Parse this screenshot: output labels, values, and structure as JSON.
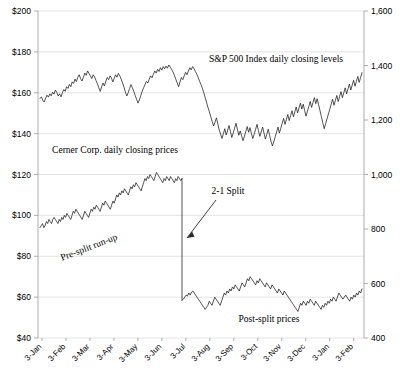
{
  "chart_data": {
    "type": "line",
    "title": "",
    "subtitle": "",
    "xlabel": "",
    "ylabel": "",
    "grid": true,
    "legend_position": "inline-annotations",
    "x_ticks": [
      "3-Jan",
      "3-Feb",
      "3-Mar",
      "3-Apr",
      "3-May",
      "3-Jun",
      "3-Jul",
      "3-Aug",
      "3-Sep",
      "3-Oct",
      "3-Nov",
      "3-Dec",
      "3-Jan",
      "3-Feb"
    ],
    "left_axis": {
      "ticks": [
        "$200",
        "$180",
        "$160",
        "$140",
        "$120",
        "$100",
        "$80",
        "$60",
        "$40"
      ],
      "values": [
        200,
        180,
        160,
        140,
        120,
        100,
        80,
        60,
        40
      ],
      "ylim": [
        40,
        200
      ],
      "format": "$"
    },
    "right_axis": {
      "ticks": [
        "1,600",
        "1,400",
        "1,200",
        "1,000",
        "800",
        "600",
        "400"
      ],
      "values": [
        1600,
        1400,
        1200,
        1000,
        800,
        600,
        400
      ],
      "ylim": [
        400,
        1600
      ]
    },
    "annotations": [
      {
        "id": "sp500-label",
        "text": "S&P 500 Index daily closing levels",
        "x": 276,
        "y": 62,
        "rotate": 0
      },
      {
        "id": "cerner-label",
        "text": "Cerner Corp. daily closing prices",
        "text_x": 115,
        "text_y": 153,
        "rotate": 0
      },
      {
        "id": "split-label",
        "text": "2-1 Split",
        "x": 228,
        "y": 194,
        "rotate": 0
      },
      {
        "id": "presplit-label",
        "text": "Pre-split run-up",
        "x": 90,
        "y": 250,
        "rotate": -21
      },
      {
        "id": "postsplit-label",
        "text": "Post-split prices",
        "x": 269,
        "y": 322,
        "rotate": 0
      }
    ],
    "split_event": {
      "label": "2-1 Split",
      "x_index": 182,
      "price_before": 118,
      "price_after": 58.5
    },
    "series": [
      {
        "name": "S&P 500 Index daily closing levels",
        "axis": "right",
        "color": "#1a1a1a",
        "values": [
          1279,
          1285,
          1272,
          1266,
          1280,
          1291,
          1284,
          1296,
          1289,
          1302,
          1295,
          1310,
          1301,
          1288,
          1296,
          1285,
          1300,
          1312,
          1305,
          1322,
          1316,
          1331,
          1322,
          1340,
          1334,
          1350,
          1341,
          1357,
          1366,
          1352,
          1343,
          1357,
          1372,
          1364,
          1380,
          1371,
          1362,
          1352,
          1366,
          1358,
          1345,
          1333,
          1318,
          1305,
          1322,
          1336,
          1325,
          1342,
          1356,
          1348,
          1362,
          1355,
          1340,
          1352,
          1366,
          1357,
          1371,
          1362,
          1350,
          1336,
          1320,
          1302,
          1288,
          1300,
          1316,
          1330,
          1318,
          1305,
          1290,
          1276,
          1262,
          1274,
          1290,
          1306,
          1318,
          1330,
          1342,
          1336,
          1350,
          1362,
          1355,
          1368,
          1380,
          1372,
          1386,
          1378,
          1392,
          1383,
          1396,
          1388,
          1398,
          1390,
          1402,
          1394,
          1386,
          1376,
          1364,
          1350,
          1336,
          1322,
          1340,
          1356,
          1348,
          1362,
          1375,
          1366,
          1380,
          1392,
          1384,
          1396,
          1388,
          1378,
          1368,
          1356,
          1342,
          1330,
          1316,
          1300,
          1282,
          1264,
          1246,
          1230,
          1212,
          1195,
          1178,
          1192,
          1208,
          1186,
          1164,
          1148,
          1132,
          1150,
          1168,
          1145,
          1162,
          1180,
          1158,
          1136,
          1152,
          1170,
          1188,
          1166,
          1144,
          1160,
          1142,
          1124,
          1140,
          1158,
          1176,
          1155,
          1172,
          1150,
          1132,
          1148,
          1166,
          1184,
          1162,
          1140,
          1156,
          1174,
          1152,
          1130,
          1148,
          1166,
          1144,
          1122,
          1105,
          1120,
          1138,
          1156,
          1174,
          1152,
          1170,
          1188,
          1206,
          1184,
          1202,
          1220,
          1198,
          1216,
          1234,
          1212,
          1230,
          1248,
          1226,
          1244,
          1262,
          1240,
          1258,
          1236,
          1214,
          1232,
          1250,
          1268,
          1246,
          1264,
          1282,
          1260,
          1278,
          1256,
          1234,
          1212,
          1190,
          1168,
          1186,
          1204,
          1222,
          1240,
          1258,
          1276,
          1254,
          1272,
          1290,
          1268,
          1286,
          1304,
          1282,
          1300,
          1318,
          1296,
          1314,
          1332,
          1310,
          1328,
          1346,
          1324,
          1342,
          1360,
          1338,
          1356,
          1374
        ],
        "note": "Upper trace, plotted against right-hand axis (400-1600)"
      },
      {
        "name": "Cerner Corp. daily closing prices",
        "axis": "left",
        "color": "#1a1a1a",
        "pre_split_values": [
          94,
          95,
          96,
          94,
          95,
          97,
          96,
          98,
          97,
          96,
          98,
          99,
          98,
          97,
          96,
          98,
          97,
          99,
          98,
          100,
          99,
          101,
          100,
          99,
          98,
          100,
          102,
          101,
          103,
          102,
          101,
          100,
          99,
          98,
          100,
          102,
          101,
          100,
          99,
          101,
          103,
          102,
          104,
          103,
          105,
          104,
          103,
          102,
          104,
          106,
          105,
          107,
          106,
          105,
          104,
          103,
          105,
          107,
          106,
          108,
          110,
          109,
          111,
          110,
          112,
          111,
          113,
          112,
          111,
          110,
          112,
          114,
          113,
          115,
          114,
          116,
          115,
          114,
          113,
          112,
          114,
          116,
          118,
          117,
          119,
          118,
          120,
          119,
          118,
          117,
          119,
          121,
          120,
          119,
          118,
          117,
          116,
          118,
          117,
          119,
          118,
          117,
          119,
          118,
          117,
          116,
          118,
          117,
          119,
          118,
          117,
          118
        ],
        "post_split_values": [
          58.5,
          59,
          60,
          61,
          60.5,
          62,
          61,
          62.5,
          63,
          62,
          61,
          60,
          59,
          58,
          57,
          56,
          55,
          54,
          55,
          56,
          58,
          57,
          56,
          58,
          60,
          59,
          58,
          57,
          56,
          58,
          60,
          62,
          61,
          63,
          62,
          64,
          63,
          65,
          64,
          66,
          65,
          64,
          63,
          65,
          67,
          66,
          65,
          67,
          69,
          68,
          70,
          69,
          68,
          67,
          66,
          68,
          67,
          69,
          68,
          67,
          66,
          65,
          67,
          66,
          65,
          64,
          66,
          65,
          64,
          63,
          62,
          64,
          63,
          62,
          61,
          63,
          62,
          61,
          60,
          59,
          58,
          57,
          56,
          55,
          54,
          53,
          55,
          57,
          56,
          58,
          57,
          56,
          58,
          57,
          59,
          58,
          57,
          56,
          58,
          57,
          56,
          55,
          54,
          56,
          55,
          57,
          56,
          58,
          57,
          59,
          58,
          60,
          59,
          58,
          60,
          62,
          61,
          60,
          59,
          60,
          61,
          60,
          59,
          58,
          60,
          59,
          61,
          60,
          62,
          61,
          63,
          62,
          64
        ]
      }
    ]
  },
  "axes": {
    "left_label": "",
    "right_label": ""
  }
}
